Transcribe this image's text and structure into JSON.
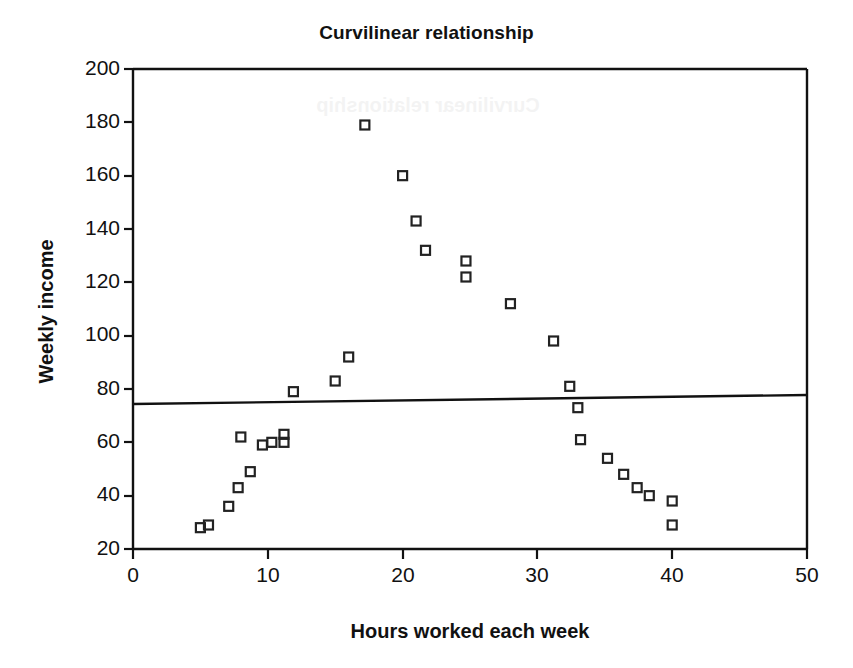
{
  "figure": {
    "title": "Curvilinear relationship",
    "background": "#ffffff",
    "ink_color": "#111111",
    "ghost_artifact": "Curvilinear relationship"
  },
  "axes": {
    "x_title": "Hours worked each week",
    "y_title": "Weekly income",
    "x_ticks": [
      "0",
      "10",
      "20",
      "30",
      "40",
      "50"
    ],
    "y_ticks": [
      "20",
      "40",
      "60",
      "80",
      "100",
      "120",
      "140",
      "160",
      "180",
      "200"
    ]
  },
  "chart_data": {
    "type": "scatter",
    "title": "Curvilinear relationship",
    "xlabel": "Hours worked each week",
    "ylabel": "Weekly income",
    "xlim": [
      0,
      50
    ],
    "ylim": [
      20,
      200
    ],
    "xticks": [
      0,
      10,
      20,
      30,
      40,
      50
    ],
    "yticks": [
      20,
      40,
      60,
      80,
      100,
      120,
      140,
      160,
      180,
      200
    ],
    "grid": false,
    "legend": "none",
    "marker": "open-square",
    "marker_color": "#222222",
    "series": [
      {
        "name": "Observations",
        "points": [
          [
            5.0,
            28
          ],
          [
            5.6,
            29
          ],
          [
            7.1,
            36
          ],
          [
            7.8,
            43
          ],
          [
            8.0,
            62
          ],
          [
            8.7,
            49
          ],
          [
            9.6,
            59
          ],
          [
            10.3,
            60
          ],
          [
            11.2,
            63
          ],
          [
            11.2,
            60
          ],
          [
            11.9,
            79
          ],
          [
            15.0,
            83
          ],
          [
            16.0,
            92
          ],
          [
            17.2,
            179
          ],
          [
            20.0,
            160
          ],
          [
            21.0,
            143
          ],
          [
            21.7,
            132
          ],
          [
            24.7,
            128
          ],
          [
            24.7,
            122
          ],
          [
            28.0,
            112
          ],
          [
            31.2,
            98
          ],
          [
            32.4,
            81
          ],
          [
            33.0,
            73
          ],
          [
            33.2,
            61
          ],
          [
            35.2,
            54
          ],
          [
            36.4,
            48
          ],
          [
            37.4,
            43
          ],
          [
            38.3,
            40
          ],
          [
            40.0,
            38
          ],
          [
            40.0,
            29
          ]
        ]
      }
    ],
    "trend_line": {
      "name": "Linear fit",
      "x": [
        0,
        50
      ],
      "y": [
        74.5,
        78.0
      ],
      "color": "#111111",
      "width": 2
    },
    "annotation": "A linear fit poorly summarizes the inverted-U (curvilinear) pattern."
  }
}
